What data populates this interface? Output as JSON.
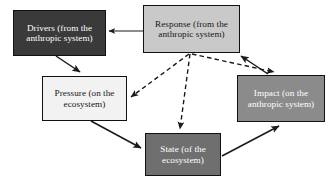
{
  "diagram": {
    "canvas": {
      "width": 335,
      "height": 186,
      "background": "#ffffff"
    },
    "nodes": [
      {
        "id": "drivers",
        "label": "Drivers (from the\nanthropic system)",
        "fill": "#3a3a3a",
        "text_color": "#ffffff",
        "border_color": "#111111"
      },
      {
        "id": "response",
        "label": "Response (from the\nanthropic system)",
        "fill": "#c9c9c9",
        "text_color": "#171717",
        "border_color": "#111111"
      },
      {
        "id": "pressure",
        "label": "Pressure (on the\necosystem)",
        "fill": "#f2f2f2",
        "text_color": "#171717",
        "border_color": "#111111"
      },
      {
        "id": "impact",
        "label": "Impact (on the\nanthropic system)",
        "fill": "#8b8b8b",
        "text_color": "#ffffff",
        "border_color": "#111111"
      },
      {
        "id": "state",
        "label": "State (of the\necosystem)",
        "fill": "#6f6f6f",
        "text_color": "#ffffff",
        "border_color": "#111111"
      }
    ],
    "edges": [
      {
        "id": "response-to-drivers",
        "from": "response",
        "to": "drivers",
        "style": "solid",
        "path": "M 143 31 L 109 31"
      },
      {
        "id": "drivers-to-pressure",
        "from": "drivers",
        "to": "pressure",
        "style": "solid",
        "path": "M 56 56 L 80 72"
      },
      {
        "id": "pressure-to-state",
        "from": "pressure",
        "to": "state",
        "style": "solid",
        "path": "M 91 121 L 141 148"
      },
      {
        "id": "state-to-impact",
        "from": "state",
        "to": "impact",
        "style": "solid",
        "path": "M 222 156 L 279 126"
      },
      {
        "id": "impact-to-response",
        "from": "impact",
        "to": "response",
        "style": "solid",
        "path": "M 268 74 L 241 56"
      },
      {
        "id": "response-to-pressure",
        "from": "response",
        "to": "pressure",
        "style": "dashed",
        "path": "M 189 54 L 131 97"
      },
      {
        "id": "response-to-state",
        "from": "response",
        "to": "state",
        "style": "dashed",
        "path": "M 190 54 L 180 129"
      },
      {
        "id": "response-to-impact",
        "from": "response",
        "to": "impact",
        "style": "dashed",
        "path": "M 192 54 L 274 72"
      }
    ],
    "edge_color": "#1a1a1a",
    "arrowhead_color": "#1a1a1a"
  }
}
